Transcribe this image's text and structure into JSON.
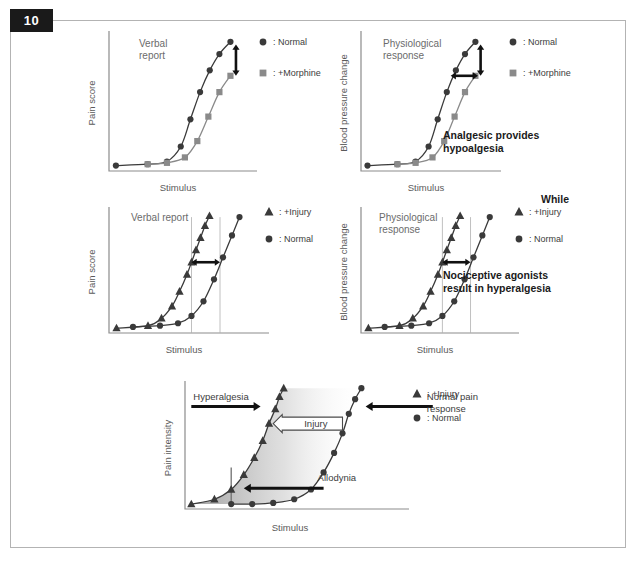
{
  "figure": {
    "number": "10",
    "badge_bg": "#1a1a1a",
    "badge_fg": "#ffffff",
    "frame_border": "#b3b3b3"
  },
  "colors": {
    "dark": "#3a3a3a",
    "gray": "#8a8a8a",
    "arrow": "#111111",
    "axis": "#8c8c8c",
    "text": "#5a5a5a",
    "refline": "#b0b0b0"
  },
  "notes": {
    "hypoalgesia": "Analgesic provides\nhypoalgesia",
    "while": "While",
    "hyperalgesia": "Nociceptive agonists\nresult in hyperalgesia"
  },
  "panels": [
    {
      "id": "verbal-morphine",
      "inner_title": "Verbal\nreport",
      "ylabel": "Pain score",
      "xlabel": "Stimulus",
      "legend": [
        {
          "symbol": "circle",
          "color": "#3a3a3a",
          "label": ": Normal"
        },
        {
          "symbol": "square",
          "color": "#8a8a8a",
          "label": ": +Morphine"
        }
      ],
      "series": [
        {
          "name": "Normal",
          "symbol": "circle",
          "color": "#3a3a3a",
          "x": [
            5,
            28,
            42,
            52,
            59,
            66,
            73,
            80,
            88
          ],
          "y": [
            4,
            5,
            7,
            18,
            38,
            58,
            74,
            86,
            95
          ]
        },
        {
          "name": "+Morphine",
          "symbol": "square",
          "color": "#8a8a8a",
          "x": [
            28,
            42,
            55,
            64,
            72,
            80,
            88
          ],
          "y": [
            5,
            6,
            10,
            22,
            40,
            58,
            70
          ]
        }
      ],
      "annotations": [
        {
          "type": "double-arrow",
          "orient": "vertical",
          "x": 92,
          "y1": 93,
          "y2": 70
        }
      ]
    },
    {
      "id": "physio-morphine",
      "inner_title": "Physiological\nresponse",
      "ylabel": "Blood pressure change",
      "xlabel": "Stimulus",
      "legend": [
        {
          "symbol": "circle",
          "color": "#3a3a3a",
          "label": ": Normal"
        },
        {
          "symbol": "square",
          "color": "#8a8a8a",
          "label": ": +Morphine"
        }
      ],
      "series": [
        {
          "name": "Normal",
          "symbol": "circle",
          "color": "#3a3a3a",
          "x": [
            5,
            28,
            42,
            52,
            59,
            66,
            73,
            80,
            88
          ],
          "y": [
            4,
            5,
            7,
            18,
            38,
            58,
            74,
            86,
            95
          ]
        },
        {
          "name": "+Morphine",
          "symbol": "square",
          "color": "#8a8a8a",
          "x": [
            28,
            42,
            55,
            64,
            72,
            80,
            88
          ],
          "y": [
            5,
            6,
            10,
            22,
            40,
            58,
            70
          ]
        }
      ],
      "annotations": [
        {
          "type": "double-arrow",
          "orient": "vertical",
          "x": 92,
          "y1": 93,
          "y2": 70
        },
        {
          "type": "double-arrow",
          "orient": "horizontal",
          "y": 70,
          "x1": 69,
          "x2": 90
        }
      ]
    },
    {
      "id": "verbal-injury",
      "inner_title": "Verbal report",
      "ylabel": "Pain score",
      "xlabel": "Stimulus",
      "legend": [
        {
          "symbol": "triangle",
          "color": "#3a3a3a",
          "label": ": +Injury"
        },
        {
          "symbol": "circle",
          "color": "#3a3a3a",
          "label": ": Normal"
        }
      ],
      "series": [
        {
          "name": "+Injury",
          "symbol": "triangle",
          "color": "#3a3a3a",
          "x": [
            5,
            26,
            35,
            42,
            47,
            52,
            55,
            58,
            61,
            64,
            67
          ],
          "y": [
            4,
            6,
            12,
            22,
            34,
            48,
            58,
            68,
            78,
            88,
            96
          ]
        },
        {
          "name": "Normal",
          "symbol": "circle",
          "color": "#3a3a3a",
          "x": [
            16,
            34,
            46,
            55,
            63,
            70,
            76,
            82,
            87
          ],
          "y": [
            5,
            6,
            8,
            14,
            26,
            44,
            62,
            80,
            95
          ]
        }
      ],
      "annotations": [
        {
          "type": "double-arrow",
          "orient": "horizontal",
          "y": 58,
          "x1": 55,
          "x2": 74
        },
        {
          "type": "refline",
          "x": 55
        },
        {
          "type": "refline",
          "x": 74
        }
      ]
    },
    {
      "id": "physio-injury",
      "inner_title": "Physiological\nresponse",
      "ylabel": "Blood pressure change",
      "xlabel": "Stimulus",
      "legend": [
        {
          "symbol": "triangle",
          "color": "#3a3a3a",
          "label": ": +Injury"
        },
        {
          "symbol": "circle",
          "color": "#3a3a3a",
          "label": ": Normal"
        }
      ],
      "series": [
        {
          "name": "+Injury",
          "symbol": "triangle",
          "color": "#3a3a3a",
          "x": [
            5,
            26,
            35,
            42,
            47,
            52,
            55,
            58,
            61,
            64,
            67
          ],
          "y": [
            4,
            6,
            12,
            22,
            34,
            48,
            58,
            68,
            78,
            88,
            96
          ]
        },
        {
          "name": "Normal",
          "symbol": "circle",
          "color": "#3a3a3a",
          "x": [
            16,
            34,
            46,
            55,
            63,
            70,
            76,
            82,
            87
          ],
          "y": [
            5,
            6,
            8,
            14,
            26,
            44,
            62,
            80,
            95
          ]
        }
      ],
      "annotations": [
        {
          "type": "double-arrow",
          "orient": "horizontal",
          "y": 58,
          "x1": 55,
          "x2": 74
        },
        {
          "type": "refline",
          "x": 55
        },
        {
          "type": "refline",
          "x": 74
        }
      ]
    },
    {
      "id": "allodynia-summary",
      "inner_title": "",
      "ylabel": "Pain intensity",
      "xlabel": "Stimulus",
      "legend": [
        {
          "symbol": "triangle",
          "color": "#3a3a3a",
          "label": ": +Injury"
        },
        {
          "symbol": "circle",
          "color": "#3a3a3a",
          "label": ": Normal"
        }
      ],
      "series": [
        {
          "name": "+Injury",
          "symbol": "triangle",
          "color": "#3a3a3a",
          "x": [
            3,
            14,
            22,
            28,
            33,
            37,
            40,
            43,
            45,
            47
          ],
          "y": [
            4,
            8,
            16,
            28,
            42,
            56,
            70,
            82,
            92,
            99
          ]
        },
        {
          "name": "Normal",
          "symbol": "circle",
          "color": "#3a3a3a",
          "x": [
            22,
            32,
            42,
            52,
            60,
            66,
            71,
            75,
            78,
            81,
            84
          ],
          "y": [
            4,
            4,
            5,
            8,
            16,
            30,
            46,
            62,
            78,
            90,
            99
          ]
        }
      ],
      "annotations": [
        {
          "type": "labeled-arrow",
          "label": "Hyperalgesia",
          "dir": "right",
          "x1": 3,
          "x2": 36,
          "y": 84
        },
        {
          "type": "labeled-arrow",
          "label": "Normal pain\nresponse",
          "dir": "left",
          "x1": 118,
          "x2": 86,
          "y": 84
        },
        {
          "type": "outline-arrow",
          "label": "Injury",
          "dir": "left",
          "x1": 75,
          "x2": 42,
          "y": 70
        },
        {
          "type": "labeled-arrow",
          "label": "Allodynia",
          "dir": "left",
          "x1": 66,
          "x2": 28,
          "y": 17
        },
        {
          "type": "vline",
          "x": 22,
          "y1": 4,
          "y2": 34
        }
      ],
      "shading": {
        "from": "#9a9a9a",
        "to": "#ffffff"
      }
    }
  ]
}
